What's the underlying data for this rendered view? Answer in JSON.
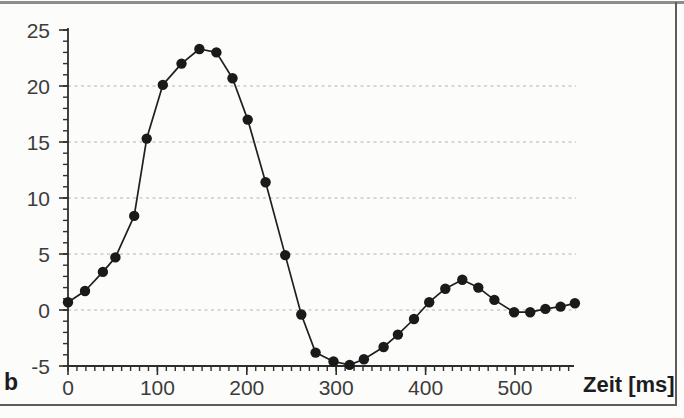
{
  "figure": {
    "panel_label": "b",
    "x_axis_label": "Zeit [ms]"
  },
  "colors": {
    "ink": "#1f1f1f",
    "axis": "#2e2e2e",
    "grid": "#b2b2b2",
    "tick_label": "#3c3c3c",
    "background": "#fcfcfb",
    "marker": "#1a1a1a"
  },
  "chart_data": {
    "type": "line",
    "title": "",
    "xlabel": "Zeit [ms]",
    "ylabel": "",
    "xlim": [
      0,
      565
    ],
    "ylim": [
      -5,
      25
    ],
    "xticks": [
      0,
      100,
      200,
      300,
      400,
      500
    ],
    "yticks": [
      25,
      20,
      15,
      10,
      5,
      0,
      -5
    ],
    "x_minor_step": 10,
    "y_minor_step": 1,
    "gridlines_y": [
      0,
      5,
      10,
      15,
      20
    ],
    "grid_style": "dashed",
    "legend": "none",
    "marker": "filled-circle",
    "x": [
      0,
      19,
      39,
      53,
      74,
      88,
      106,
      127,
      147,
      166,
      184,
      201,
      221,
      243,
      261,
      277,
      297,
      315,
      331,
      353,
      369,
      387,
      404,
      422,
      441,
      459,
      477,
      499,
      517,
      534,
      551,
      567
    ],
    "y": [
      0.7,
      1.7,
      3.4,
      4.7,
      8.4,
      15.3,
      20.1,
      22.0,
      23.3,
      23.0,
      20.7,
      17.0,
      11.4,
      4.9,
      -0.4,
      -3.8,
      -4.6,
      -4.9,
      -4.4,
      -3.3,
      -2.2,
      -0.8,
      0.7,
      1.9,
      2.7,
      2.0,
      0.9,
      -0.2,
      -0.2,
      0.1,
      0.3,
      0.6
    ]
  }
}
